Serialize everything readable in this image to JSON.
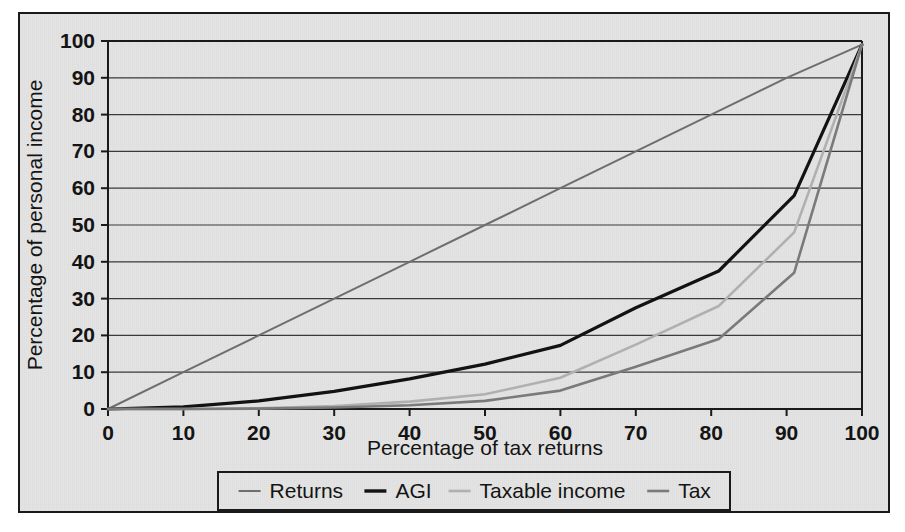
{
  "chart_data": {
    "type": "line",
    "title": "",
    "subtitle": "",
    "xlabel": "Percentage of tax returns",
    "ylabel": "Percentage of personal income",
    "xlim": [
      0,
      100
    ],
    "ylim": [
      0,
      100
    ],
    "xticks": [
      0,
      10,
      20,
      30,
      40,
      50,
      60,
      70,
      80,
      90,
      100
    ],
    "yticks": [
      0,
      10,
      20,
      30,
      40,
      50,
      60,
      70,
      80,
      90,
      100
    ],
    "xtick_labels": [
      "0",
      "10",
      "20",
      "30",
      "40",
      "50",
      "60",
      "70",
      "80",
      "90",
      "100"
    ],
    "ytick_labels": [
      "0",
      "10",
      "20",
      "30",
      "40",
      "50",
      "60",
      "70",
      "80",
      "90",
      "100"
    ],
    "grid": "horizontal",
    "legend_position": "bottom",
    "series": [
      {
        "name": "Returns",
        "color": "#6e6e6e",
        "width": 2.0,
        "x": [
          0,
          10,
          20,
          30,
          40,
          50,
          60,
          70,
          80,
          90,
          100
        ],
        "y": [
          0,
          10,
          20,
          30,
          40,
          50,
          60,
          70,
          80,
          90,
          99
        ]
      },
      {
        "name": "AGI",
        "color": "#121212",
        "width": 3.2,
        "x": [
          0,
          10,
          20,
          30,
          40,
          50,
          60,
          70,
          81,
          91,
          100
        ],
        "y": [
          0,
          0.6,
          2.2,
          4.8,
          8.2,
          12.2,
          17.3,
          27.5,
          37.5,
          58.0,
          99.0
        ]
      },
      {
        "name": "Taxable income",
        "color": "#b0b0b0",
        "width": 2.6,
        "x": [
          0,
          10,
          20,
          30,
          40,
          50,
          60,
          70,
          81,
          91,
          100
        ],
        "y": [
          0,
          0.0,
          0.2,
          0.8,
          2.0,
          4.0,
          8.5,
          17.5,
          28.0,
          48.0,
          99.0
        ]
      },
      {
        "name": "Tax",
        "color": "#7a7a7a",
        "width": 2.6,
        "x": [
          0,
          10,
          20,
          30,
          40,
          50,
          60,
          70,
          81,
          91,
          100
        ],
        "y": [
          0,
          0.0,
          0.1,
          0.4,
          1.0,
          2.2,
          5.0,
          11.5,
          19.0,
          37.0,
          99.0
        ]
      }
    ]
  },
  "axes": {
    "y_title": "Percentage of personal income",
    "x_title": "Percentage of tax returns",
    "y_ticks": [
      "100",
      "90",
      "80",
      "70",
      "60",
      "50",
      "40",
      "30",
      "20",
      "10",
      "0"
    ],
    "x_ticks": [
      "0",
      "10",
      "20",
      "30",
      "40",
      "50",
      "60",
      "70",
      "80",
      "90",
      "100"
    ]
  },
  "legend": {
    "items": [
      {
        "label": "Returns",
        "color": "#6e6e6e",
        "width": 2.0
      },
      {
        "label": "AGI",
        "color": "#121212",
        "width": 3.4
      },
      {
        "label": "Taxable income",
        "color": "#b0b0b0",
        "width": 2.6
      },
      {
        "label": "Tax",
        "color": "#7a7a7a",
        "width": 2.6
      }
    ]
  },
  "colors": {
    "background": "#e4e4e4",
    "frame": "#1a1a1a",
    "axis": "#1a1a1a",
    "gridline": "#3a3a3a",
    "text": "#141414"
  }
}
